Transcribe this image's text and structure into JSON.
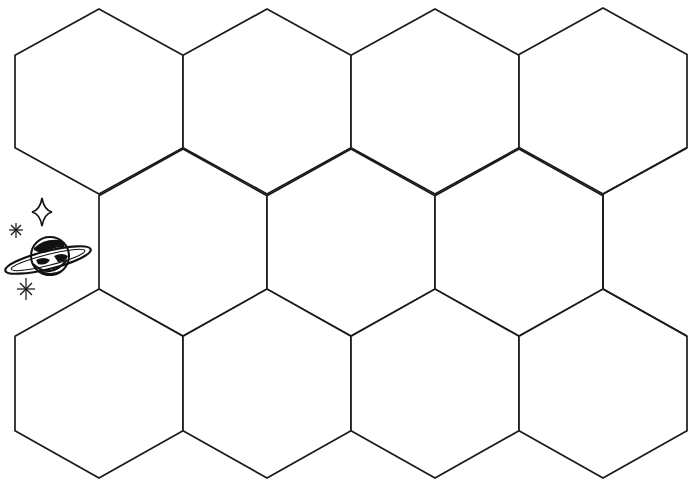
{
  "document": {
    "type": "printable hexagon grid worksheet",
    "background": "#ffffff",
    "line_color": "#1a1a1a"
  },
  "grid": {
    "rows": [
      {
        "name": "top-row",
        "cells": [
          {
            "cx": 99,
            "top": 9,
            "bottom": 194
          },
          {
            "cx": 267,
            "top": 9,
            "bottom": 194
          },
          {
            "cx": 435,
            "top": 9,
            "bottom": 194
          },
          {
            "cx": 603,
            "top": 8,
            "bottom": 194
          }
        ]
      },
      {
        "name": "middle-row",
        "cells": [
          {
            "cx": 183,
            "top": 149,
            "bottom": 336
          },
          {
            "cx": 351,
            "top": 149,
            "bottom": 336
          },
          {
            "cx": 519,
            "top": 149,
            "bottom": 336
          }
        ]
      },
      {
        "name": "bottom-row",
        "cells": [
          {
            "cx": 99,
            "top": 289,
            "bottom": 478
          },
          {
            "cx": 267,
            "top": 289,
            "bottom": 478
          },
          {
            "cx": 435,
            "top": 289,
            "bottom": 478
          },
          {
            "cx": 603,
            "top": 289,
            "bottom": 478
          }
        ]
      }
    ],
    "half_width": 84,
    "hex_count": 11
  },
  "clipart": {
    "name": "ringed-planet-with-stars",
    "elements": [
      "four-point-star",
      "sparkle-small",
      "ringed-planet",
      "sparkle-bottom"
    ]
  }
}
